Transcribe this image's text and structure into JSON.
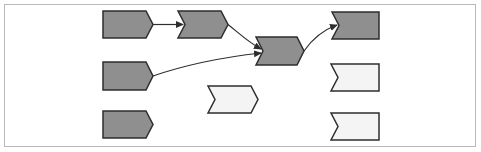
{
  "diagram": {
    "type": "flow",
    "colors": {
      "filled": "#8f8f8f",
      "empty": "#f4f4f4",
      "stroke": "#2e2e2e",
      "frame": "#b8b8b8",
      "background": "#ffffff"
    },
    "nodes": [
      {
        "id": "n1",
        "shape": "start-chevron",
        "state": "filled",
        "x": 103,
        "y": 11,
        "w": 50,
        "h": 27
      },
      {
        "id": "n2",
        "shape": "chevron",
        "state": "filled",
        "x": 178,
        "y": 11,
        "w": 50,
        "h": 27
      },
      {
        "id": "n3",
        "shape": "chevron",
        "state": "filled",
        "x": 256,
        "y": 37,
        "w": 48,
        "h": 28
      },
      {
        "id": "n4",
        "shape": "end-notch",
        "state": "filled",
        "x": 332,
        "y": 12,
        "w": 47,
        "h": 27
      },
      {
        "id": "n5",
        "shape": "start-chevron",
        "state": "filled",
        "x": 103,
        "y": 62,
        "w": 50,
        "h": 28
      },
      {
        "id": "n6",
        "shape": "chevron",
        "state": "empty",
        "x": 208,
        "y": 86,
        "w": 50,
        "h": 27
      },
      {
        "id": "n7",
        "shape": "end-notch",
        "state": "empty",
        "x": 331,
        "y": 64,
        "w": 48,
        "h": 27
      },
      {
        "id": "n8",
        "shape": "start-chevron",
        "state": "filled",
        "x": 103,
        "y": 111,
        "w": 50,
        "h": 27
      },
      {
        "id": "n9",
        "shape": "end-notch",
        "state": "empty",
        "x": 331,
        "y": 113,
        "w": 48,
        "h": 27
      }
    ],
    "edges": [
      {
        "from": "n1",
        "to": "n2"
      },
      {
        "from": "n2",
        "to": "n3"
      },
      {
        "from": "n5",
        "to": "n3"
      },
      {
        "from": "n3",
        "to": "n4"
      }
    ]
  }
}
